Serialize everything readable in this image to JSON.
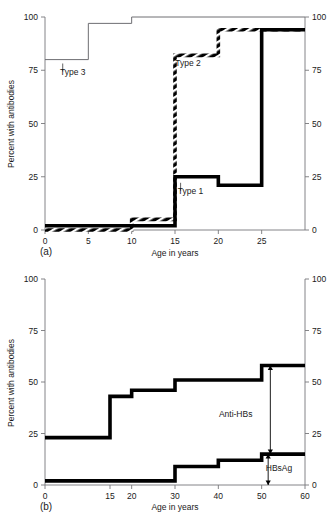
{
  "figure": {
    "panel_a_label": "(a)",
    "panel_b_label": "(b)",
    "y_axis_title": "Percent with antibodies",
    "x_axis_title": "Age in years"
  },
  "chart_data": [
    {
      "type": "line",
      "panel": "(a)",
      "title": "",
      "xlabel": "Age in years",
      "ylabel": "Percent with antibodies",
      "xlim": [
        0,
        30
      ],
      "ylim": [
        0,
        100
      ],
      "xticks": [
        0,
        5,
        10,
        15,
        20,
        25
      ],
      "yticks": [
        0,
        25,
        50,
        75,
        100
      ],
      "right_axis": true,
      "right_yticks": [
        0,
        25,
        50,
        75,
        100
      ],
      "grid": false,
      "legend": "inline-annotations",
      "step_style": "post",
      "series": [
        {
          "name": "Type 3",
          "style": "thin-solid",
          "x": [
            0,
            5,
            10,
            30
          ],
          "values": [
            80,
            97,
            100,
            100
          ]
        },
        {
          "name": "Type 2",
          "style": "hatched-thick",
          "x": [
            0,
            10,
            15,
            20,
            30
          ],
          "values": [
            0,
            5,
            82,
            94,
            94
          ]
        },
        {
          "name": "Type 1",
          "style": "solid-thick",
          "x": [
            0,
            15,
            20,
            25,
            30
          ],
          "values": [
            2,
            25,
            21,
            94,
            94
          ]
        }
      ],
      "annotations": [
        {
          "text": "Type 3",
          "x": 3.2,
          "y": 73,
          "leader": true
        },
        {
          "text": "Type 2",
          "x": 16.5,
          "y": 77,
          "leader": false
        },
        {
          "text": "Type 1",
          "x": 16.8,
          "y": 17,
          "leader": true
        }
      ]
    },
    {
      "type": "line",
      "panel": "(b)",
      "title": "",
      "xlabel": "Age in years",
      "ylabel": "Percent with antibodies",
      "xlim": [
        0,
        60
      ],
      "ylim": [
        0,
        100
      ],
      "xticks": [
        0,
        15,
        20,
        30,
        40,
        50,
        60
      ],
      "yticks": [
        0,
        25,
        50,
        75,
        100
      ],
      "right_axis": true,
      "right_yticks": [
        0,
        25,
        50,
        75,
        100
      ],
      "grid": false,
      "legend": "inline-annotations",
      "step_style": "post",
      "series": [
        {
          "name": "Anti-HBs",
          "style": "solid-thick",
          "x": [
            0,
            15,
            20,
            30,
            50,
            60
          ],
          "values": [
            23,
            43,
            46,
            51,
            58,
            58
          ]
        },
        {
          "name": "HBsAg",
          "style": "solid-thick",
          "x": [
            0,
            30,
            40,
            50,
            60
          ],
          "values": [
            2,
            9,
            12,
            15,
            15
          ]
        }
      ],
      "annotations": [
        {
          "text": "Anti-HBs",
          "x": 44,
          "y": 33,
          "arrow_from": 15,
          "arrow_to": 58,
          "arrow_x": 52
        },
        {
          "text": "HBsAg",
          "x": 54,
          "y": 7,
          "arrow_from": 0,
          "arrow_to": 15,
          "arrow_x": 51.5
        }
      ]
    }
  ]
}
